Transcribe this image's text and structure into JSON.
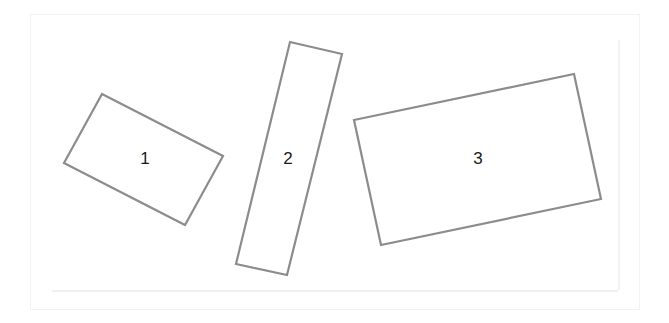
{
  "diagram": {
    "title": "",
    "stroke_color": "#8c8c8c",
    "label_color": "#1a1a1a",
    "background": "#ffffff",
    "shapes": [
      {
        "id": "1",
        "label": "1",
        "type": "rotated-rectangle",
        "points": [
          [
            102,
            94
          ],
          [
            223,
            156
          ],
          [
            185,
            225
          ],
          [
            64,
            163
          ]
        ],
        "label_pos": [
          145,
          160
        ]
      },
      {
        "id": "2",
        "label": "2",
        "type": "rotated-rectangle",
        "points": [
          [
            290,
            42
          ],
          [
            342,
            54
          ],
          [
            287,
            275
          ],
          [
            236,
            264
          ]
        ],
        "label_pos": [
          288,
          160
        ]
      },
      {
        "id": "3",
        "label": "3",
        "type": "rotated-rectangle",
        "points": [
          [
            354,
            120
          ],
          [
            574,
            74
          ],
          [
            601,
            199
          ],
          [
            381,
            245
          ]
        ],
        "label_pos": [
          478,
          160
        ]
      }
    ]
  }
}
